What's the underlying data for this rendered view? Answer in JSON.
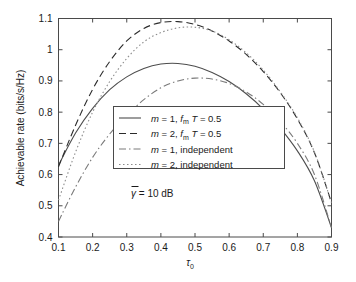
{
  "chart_data": {
    "type": "line",
    "title": "",
    "xlabel": "τ₀",
    "ylabel": "Achievable rate (bits/s/Hz)",
    "xlim": [
      0.1,
      0.9
    ],
    "ylim": [
      0.4,
      1.1
    ],
    "grid": false,
    "legend_position": "center",
    "xticks": [
      "0.1",
      "0.2",
      "0.3",
      "0.4",
      "0.5",
      "0.6",
      "0.7",
      "0.8",
      "0.9"
    ],
    "xtick_values": [
      0.1,
      0.2,
      0.3,
      0.4,
      0.5,
      0.6,
      0.7,
      0.8,
      0.9
    ],
    "yticks": [
      "0.4",
      "0.5",
      "0.6",
      "0.7",
      "0.8",
      "0.9",
      "1",
      "1.1"
    ],
    "ytick_values": [
      0.4,
      0.5,
      0.6,
      0.7,
      0.8,
      0.9,
      1.0,
      1.1
    ],
    "annotations": [
      {
        "text": "γ̄ = 10 dB",
        "x": 0.33,
        "y": 0.66
      }
    ],
    "x": [
      0.1,
      0.15,
      0.2,
      0.25,
      0.3,
      0.35,
      0.4,
      0.45,
      0.5,
      0.55,
      0.6,
      0.65,
      0.7,
      0.75,
      0.8,
      0.85,
      0.9
    ],
    "series": [
      {
        "name": "m = 1, f_m T = 0.5",
        "legend_label": "m = 1, f",
        "style": "solid",
        "color": "#4d4d4d",
        "values": [
          0.63,
          0.733,
          0.812,
          0.872,
          0.913,
          0.94,
          0.954,
          0.956,
          0.947,
          0.927,
          0.898,
          0.859,
          0.81,
          0.749,
          0.676,
          0.58,
          0.43
        ]
      },
      {
        "name": "m = 2, f_m T = 0.5",
        "legend_label": "m = 2, f",
        "style": "dashed",
        "color": "#2b2b2b",
        "values": [
          0.625,
          0.758,
          0.873,
          0.962,
          1.028,
          1.068,
          1.087,
          1.09,
          1.081,
          1.06,
          1.028,
          0.985,
          0.93,
          0.862,
          0.778,
          0.67,
          0.51
        ]
      },
      {
        "name": "m = 1, independent",
        "legend_label": "m = 1, independent",
        "style": "dashdot",
        "color": "#7a7a7a",
        "values": [
          0.45,
          0.56,
          0.655,
          0.73,
          0.79,
          0.84,
          0.878,
          0.9,
          0.909,
          0.906,
          0.892,
          0.865,
          0.825,
          0.77,
          0.7,
          0.6,
          0.43
        ]
      },
      {
        "name": "m = 2, independent",
        "legend_label": "m = 2, independent",
        "style": "dotted",
        "color": "#8c8c8c",
        "values": [
          0.518,
          0.672,
          0.8,
          0.898,
          0.972,
          1.025,
          1.055,
          1.07,
          1.072,
          1.06,
          1.032,
          0.99,
          0.935,
          0.865,
          0.782,
          0.672,
          0.51
        ]
      }
    ]
  },
  "legend": {
    "entries": [
      {
        "prefix": "m",
        "eq1": " = 1, ",
        "fm": "f",
        "fmsub": "m",
        "tail": " T = 0.5",
        "style": "solid"
      },
      {
        "prefix": "m",
        "eq1": " = 2, ",
        "fm": "f",
        "fmsub": "m",
        "tail": " T = 0.5",
        "style": "dashed"
      },
      {
        "prefix": "m",
        "eq1": " = 1, independent",
        "fm": "",
        "fmsub": "",
        "tail": "",
        "style": "dashdot"
      },
      {
        "prefix": "m",
        "eq1": " = 2, independent",
        "fm": "",
        "fmsub": "",
        "tail": "",
        "style": "dotted"
      }
    ]
  },
  "axes": {
    "ylabel": "Achievable rate (bits/s/Hz)",
    "xlabel_base": "τ",
    "xlabel_sub": "0"
  },
  "annotation": {
    "gamma": "γ",
    "rest": " = 10 dB"
  },
  "colors": {
    "axis": "#4a4a4a",
    "text": "#1a1a1a",
    "background": "#ffffff"
  }
}
